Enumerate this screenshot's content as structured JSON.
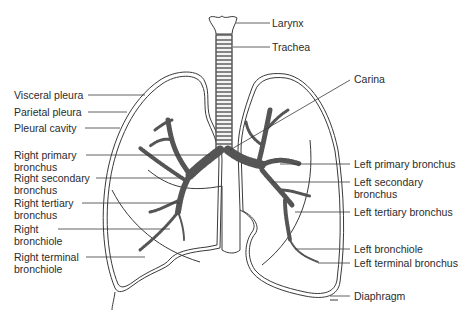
{
  "diagram": {
    "labels_left": [
      {
        "id": "visceral-pleura",
        "text": "Visceral pleura"
      },
      {
        "id": "parietal-pleura",
        "text": "Parietal pleura"
      },
      {
        "id": "pleural-cavity",
        "text": "Pleural cavity"
      },
      {
        "id": "right-primary-bronchus",
        "line1": "Right primary",
        "line2": "bronchus"
      },
      {
        "id": "right-secondary-bronchus",
        "line1": "Right secondary",
        "line2": "bronchus"
      },
      {
        "id": "right-tertiary-bronchus",
        "line1": "Right tertiary",
        "line2": "bronchus"
      },
      {
        "id": "right-bronchiole",
        "line1": "Right",
        "line2": "bronchiole"
      },
      {
        "id": "right-terminal-bronchiole",
        "line1": "Right terminal",
        "line2": "bronchiole"
      }
    ],
    "labels_right": [
      {
        "id": "larynx",
        "text": "Larynx"
      },
      {
        "id": "trachea",
        "text": "Trachea"
      },
      {
        "id": "carina",
        "text": "Carina"
      },
      {
        "id": "left-primary-bronchus",
        "text": "Left primary bronchus"
      },
      {
        "id": "left-secondary-bronchus",
        "line1": "Left secondary",
        "line2": "bronchus"
      },
      {
        "id": "left-tertiary-bronchus",
        "text": "Left tertiary bronchus"
      },
      {
        "id": "left-bronchiole",
        "text": "Left bronchiole"
      },
      {
        "id": "left-terminal-bronchus",
        "text": "Left terminal bronchus"
      },
      {
        "id": "diaphragm",
        "text": "Diaphragm"
      }
    ],
    "colors": {
      "line": "#3a3a3a",
      "bronchi": "#555555",
      "text": "#2b2b2b",
      "background": "#ffffff"
    }
  }
}
